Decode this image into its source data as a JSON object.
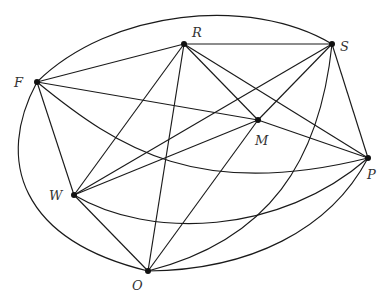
{
  "diagram": {
    "type": "graph",
    "nodes": [
      {
        "id": "F",
        "label": "F",
        "x": 37,
        "y": 82,
        "lx": 14,
        "ly": 87
      },
      {
        "id": "R",
        "label": "R",
        "x": 184,
        "y": 44,
        "lx": 192,
        "ly": 37
      },
      {
        "id": "S",
        "label": "S",
        "x": 332,
        "y": 44,
        "lx": 340,
        "ly": 51
      },
      {
        "id": "M",
        "label": "M",
        "x": 258,
        "y": 120,
        "lx": 255,
        "ly": 145
      },
      {
        "id": "P",
        "label": "P",
        "x": 368,
        "y": 158,
        "lx": 367,
        "ly": 179
      },
      {
        "id": "W",
        "label": "W",
        "x": 74,
        "y": 195,
        "lx": 49,
        "ly": 200
      },
      {
        "id": "O",
        "label": "O",
        "x": 148,
        "y": 271,
        "lx": 132,
        "ly": 290
      }
    ],
    "edges": [
      {
        "from": "F",
        "to": "R",
        "d": "M37,82 L184,44"
      },
      {
        "from": "F",
        "to": "M",
        "d": "M37,82 L258,120"
      },
      {
        "from": "F",
        "to": "W",
        "d": "M37,82 L74,195"
      },
      {
        "from": "F",
        "to": "S",
        "d": "M37,82 C110,10 250,-5 332,44"
      },
      {
        "from": "F",
        "to": "O",
        "d": "M37,82 C-5,160 20,240 148,271"
      },
      {
        "from": "F",
        "to": "P",
        "d": "M37,82 C120,150 200,200 368,158"
      },
      {
        "from": "R",
        "to": "S",
        "d": "M184,44 L332,44"
      },
      {
        "from": "R",
        "to": "W",
        "d": "M184,44 L74,195"
      },
      {
        "from": "R",
        "to": "O",
        "d": "M184,44 L148,271"
      },
      {
        "from": "R",
        "to": "M",
        "d": "M184,44 L258,120"
      },
      {
        "from": "R",
        "to": "P",
        "d": "M184,44 L368,158"
      },
      {
        "from": "S",
        "to": "W",
        "d": "M332,44 L74,195"
      },
      {
        "from": "S",
        "to": "M",
        "d": "M332,44 L258,120"
      },
      {
        "from": "S",
        "to": "P",
        "d": "M332,44 L368,158"
      },
      {
        "from": "S",
        "to": "O",
        "d": "M332,44 C320,160 270,240 148,271"
      },
      {
        "from": "M",
        "to": "W",
        "d": "M258,120 L74,195"
      },
      {
        "from": "M",
        "to": "P",
        "d": "M258,120 L368,158"
      },
      {
        "from": "M",
        "to": "O",
        "d": "M258,120 L148,271"
      },
      {
        "from": "W",
        "to": "O",
        "d": "M74,195 L148,271"
      },
      {
        "from": "W",
        "to": "P",
        "d": "M74,195 C150,240 280,235 368,158"
      },
      {
        "from": "O",
        "to": "P",
        "d": "M148,271 C250,270 330,230 368,158"
      }
    ]
  }
}
